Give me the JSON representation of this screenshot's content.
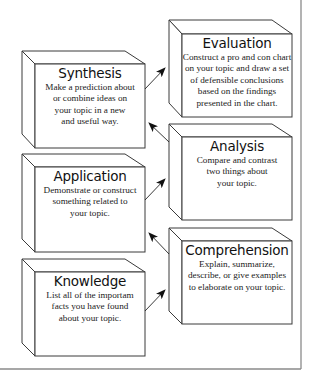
{
  "diagram": {
    "type": "hierarchy-pyramid",
    "stroke_color": "#3a3a3a",
    "frame_color": "#8a8a8a",
    "levels": [
      {
        "id": "knowledge",
        "title": "Knowledge",
        "description": "List all of the importam facts you have found about your topic.",
        "lines": [
          "List all of the importam",
          "facts you have found",
          "about your topic."
        ]
      },
      {
        "id": "comprehension",
        "title": "Comprehension",
        "description": "Explain, summarize, describe, or give examples to elaborate on your topic.",
        "lines": [
          "Explain, summarize,",
          "describe, or give examples",
          "to elaborate on your topic."
        ]
      },
      {
        "id": "application",
        "title": "Application",
        "description": "Demonstrate or construct something related to your topic.",
        "lines": [
          "Demonstrate or construct",
          "something related to",
          "your topic."
        ]
      },
      {
        "id": "analysis",
        "title": "Analysis",
        "description": "Compare and contrast two things about your topic.",
        "lines": [
          "Compare and contrast",
          "two things about",
          "your topic."
        ]
      },
      {
        "id": "synthesis",
        "title": "Synthesis",
        "description": "Make a prediction about or combine ideas on your topic in a new and useful way.",
        "lines": [
          "Make a prediction about",
          "or combine ideas on",
          "your topic in a new",
          "and useful way."
        ]
      },
      {
        "id": "evaluation",
        "title": "Evaluation",
        "description": "Construct a pro and con chart on your topic and draw a set of defensible conclusions based on the findings presented in the chart.",
        "lines": [
          "Construct a pro and con chart",
          "on your topic and draw a set",
          "of defensible conclusions",
          "based on the findings",
          "presented in the chart."
        ]
      }
    ],
    "arrows": [
      {
        "from": "knowledge",
        "to": "comprehension"
      },
      {
        "from": "comprehension",
        "to": "application"
      },
      {
        "from": "application",
        "to": "analysis"
      },
      {
        "from": "analysis",
        "to": "synthesis"
      },
      {
        "from": "synthesis",
        "to": "evaluation"
      }
    ]
  }
}
